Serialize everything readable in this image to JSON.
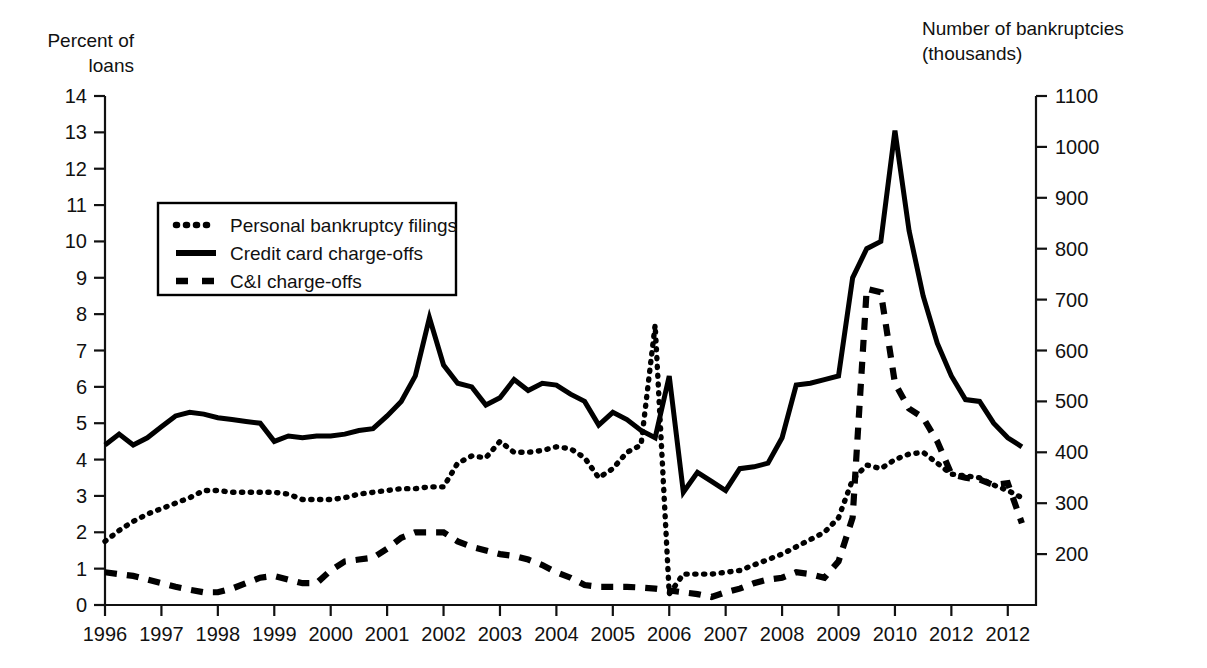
{
  "chart_data": {
    "type": "line",
    "title": "",
    "subtitle": "",
    "xlabel": "",
    "ylabel": "Percent of\nloans",
    "ylabel_right": "Number of bankruptcies\n(thousands)",
    "grid": false,
    "legend_position": "upper-left-inside",
    "x_axis": {
      "tick_labels": [
        "1996",
        "1997",
        "1998",
        "1999",
        "2000",
        "2001",
        "2002",
        "2003",
        "2004",
        "2005",
        "2006",
        "2007",
        "2008",
        "2009",
        "2010",
        "2012",
        "2012"
      ],
      "range": [
        1996,
        2012.5
      ]
    },
    "y_axis_left": {
      "label": "Percent of loans",
      "tick_labels": [
        "0",
        "1",
        "2",
        "3",
        "4",
        "5",
        "6",
        "7",
        "8",
        "9",
        "10",
        "11",
        "12",
        "13",
        "14"
      ],
      "values": [
        0,
        1,
        2,
        3,
        4,
        5,
        6,
        7,
        8,
        9,
        10,
        11,
        12,
        13,
        14
      ],
      "ylim": [
        0,
        14
      ]
    },
    "y_axis_right": {
      "label": "Number of bankruptcies (thousands)",
      "tick_labels": [
        "200",
        "300",
        "400",
        "500",
        "600",
        "700",
        "800",
        "900",
        "1000",
        "1100"
      ],
      "values": [
        200,
        300,
        400,
        500,
        600,
        700,
        800,
        900,
        1000,
        1100
      ],
      "ylim": [
        100,
        1100
      ]
    },
    "legend": [
      {
        "label": "Personal bankruptcy filings",
        "style": "dotted",
        "color": "#000000",
        "axis": "right"
      },
      {
        "label": "Credit card charge-offs",
        "style": "solid",
        "color": "#000000",
        "axis": "left"
      },
      {
        "label": "C&I charge-offs",
        "style": "dashed",
        "color": "#000000",
        "axis": "left"
      }
    ],
    "series": [
      {
        "name": "Personal bankruptcy filings",
        "style": "dotted",
        "axis": "left_scale_equivalent",
        "x": [
          1996.0,
          1996.25,
          1996.5,
          1996.75,
          1997.0,
          1997.25,
          1997.5,
          1997.75,
          1998.0,
          1998.25,
          1998.5,
          1998.75,
          1999.0,
          1999.25,
          1999.5,
          1999.75,
          2000.0,
          2000.25,
          2000.5,
          2000.75,
          2001.0,
          2001.25,
          2001.5,
          2001.75,
          2002.0,
          2002.25,
          2002.5,
          2002.75,
          2003.0,
          2003.25,
          2003.5,
          2003.75,
          2004.0,
          2004.25,
          2004.5,
          2004.75,
          2005.0,
          2005.25,
          2005.5,
          2005.75,
          2006.0,
          2006.25,
          2006.5,
          2006.75,
          2007.0,
          2007.25,
          2007.5,
          2007.75,
          2008.0,
          2008.25,
          2008.5,
          2008.75,
          2009.0,
          2009.25,
          2009.5,
          2009.75,
          2010.0,
          2010.25,
          2010.5,
          2010.75,
          2011.0,
          2011.25,
          2011.5,
          2011.75,
          2012.0,
          2012.25
        ],
        "values": [
          1.75,
          2.05,
          2.3,
          2.5,
          2.65,
          2.8,
          2.95,
          3.15,
          3.15,
          3.1,
          3.1,
          3.1,
          3.1,
          3.05,
          2.9,
          2.9,
          2.9,
          2.95,
          3.05,
          3.1,
          3.15,
          3.2,
          3.2,
          3.25,
          3.25,
          3.9,
          4.1,
          4.05,
          4.5,
          4.2,
          4.2,
          4.25,
          4.35,
          4.3,
          4.05,
          3.5,
          3.75,
          4.2,
          4.4,
          7.7,
          0.3,
          0.85,
          0.85,
          0.85,
          0.9,
          0.95,
          1.1,
          1.25,
          1.4,
          1.6,
          1.8,
          2.0,
          2.4,
          3.45,
          3.85,
          3.75,
          4.0,
          4.15,
          4.2,
          3.9,
          3.6,
          3.55,
          3.5,
          3.3,
          3.15,
          2.95
        ]
      },
      {
        "name": "Credit card charge-offs",
        "style": "solid",
        "axis": "left",
        "x": [
          1996.0,
          1996.25,
          1996.5,
          1996.75,
          1997.0,
          1997.25,
          1997.5,
          1997.75,
          1998.0,
          1998.25,
          1998.5,
          1998.75,
          1999.0,
          1999.25,
          1999.5,
          1999.75,
          2000.0,
          2000.25,
          2000.5,
          2000.75,
          2001.0,
          2001.25,
          2001.5,
          2001.75,
          2002.0,
          2002.25,
          2002.5,
          2002.75,
          2003.0,
          2003.25,
          2003.5,
          2003.75,
          2004.0,
          2004.25,
          2004.5,
          2004.75,
          2005.0,
          2005.25,
          2005.5,
          2005.75,
          2006.0,
          2006.25,
          2006.5,
          2006.75,
          2007.0,
          2007.25,
          2007.5,
          2007.75,
          2008.0,
          2008.25,
          2008.5,
          2008.75,
          2009.0,
          2009.25,
          2009.5,
          2009.75,
          2010.0,
          2010.25,
          2010.5,
          2010.75,
          2011.0,
          2011.25,
          2011.5,
          2011.75,
          2012.0,
          2012.25
        ],
        "values": [
          4.4,
          4.7,
          4.4,
          4.6,
          4.9,
          5.2,
          5.3,
          5.25,
          5.15,
          5.1,
          5.05,
          5.0,
          4.5,
          4.65,
          4.6,
          4.65,
          4.65,
          4.7,
          4.8,
          4.85,
          5.2,
          5.6,
          6.3,
          7.9,
          6.6,
          6.1,
          6.0,
          5.5,
          5.7,
          6.2,
          5.9,
          6.1,
          6.05,
          5.8,
          5.6,
          4.95,
          5.3,
          5.1,
          4.8,
          4.6,
          6.3,
          3.1,
          3.65,
          3.4,
          3.15,
          3.75,
          3.8,
          3.9,
          4.6,
          6.05,
          6.1,
          6.2,
          6.3,
          9.0,
          9.8,
          10.0,
          13.05,
          10.3,
          8.5,
          7.2,
          6.3,
          5.65,
          5.6,
          5.0,
          4.6,
          4.35
        ]
      },
      {
        "name": "C&I charge-offs",
        "style": "dashed",
        "axis": "left",
        "x": [
          1996.0,
          1996.25,
          1996.5,
          1996.75,
          1997.0,
          1997.25,
          1997.5,
          1997.75,
          1998.0,
          1998.25,
          1998.5,
          1998.75,
          1999.0,
          1999.25,
          1999.5,
          1999.75,
          2000.0,
          2000.25,
          2000.5,
          2000.75,
          2001.0,
          2001.25,
          2001.5,
          2001.75,
          2002.0,
          2002.25,
          2002.5,
          2002.75,
          2003.0,
          2003.25,
          2003.5,
          2003.75,
          2004.0,
          2004.25,
          2004.5,
          2004.75,
          2005.0,
          2005.25,
          2005.5,
          2005.75,
          2006.0,
          2006.25,
          2006.5,
          2006.75,
          2007.0,
          2007.25,
          2007.5,
          2007.75,
          2008.0,
          2008.25,
          2008.5,
          2008.75,
          2009.0,
          2009.25,
          2009.5,
          2009.75,
          2010.0,
          2010.25,
          2010.5,
          2010.75,
          2011.0,
          2011.25,
          2011.5,
          2011.75,
          2012.0,
          2012.25
        ],
        "values": [
          0.9,
          0.85,
          0.8,
          0.7,
          0.6,
          0.5,
          0.42,
          0.35,
          0.35,
          0.45,
          0.6,
          0.75,
          0.8,
          0.7,
          0.6,
          0.6,
          0.95,
          1.2,
          1.25,
          1.3,
          1.55,
          1.85,
          2.0,
          2.0,
          2.0,
          1.75,
          1.6,
          1.5,
          1.4,
          1.35,
          1.25,
          1.1,
          0.9,
          0.75,
          0.55,
          0.5,
          0.5,
          0.5,
          0.48,
          0.45,
          0.4,
          0.35,
          0.3,
          0.22,
          0.35,
          0.45,
          0.6,
          0.7,
          0.75,
          0.9,
          0.85,
          0.75,
          1.2,
          2.4,
          8.7,
          8.6,
          6.1,
          5.4,
          5.15,
          4.5,
          3.6,
          3.5,
          3.45,
          3.3,
          3.35,
          2.25
        ]
      }
    ],
    "annotations": {
      "spike_note": "Personal bankruptcy filings spike to 7.7 (percent-scale equivalent) in late 2005, then collapse to 0.3"
    }
  }
}
